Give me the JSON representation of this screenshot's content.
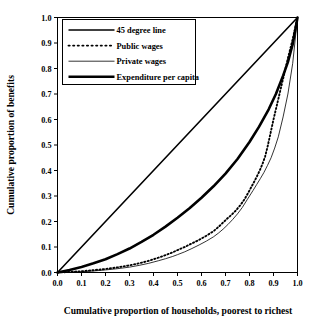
{
  "chart_data": {
    "type": "line",
    "title": "",
    "xlabel": "Cumulative proportion of households, poorest to richest",
    "ylabel": "Cumulative proportion of benefits",
    "xlim": [
      0.0,
      1.0
    ],
    "ylim": [
      0.0,
      1.0
    ],
    "grid": false,
    "legend_position": "top-left",
    "xticks": [
      "0.0",
      "0.1",
      "0.2",
      "0.3",
      "0.4",
      "0.5",
      "0.6",
      "0.7",
      "0.8",
      "0.9",
      "1.0"
    ],
    "yticks": [
      "0.0",
      "0.1",
      "0.2",
      "0.3",
      "0.4",
      "0.5",
      "0.6",
      "0.7",
      "0.8",
      "0.9",
      "1.0"
    ],
    "xtick_values": [
      0.0,
      0.1,
      0.2,
      0.3,
      0.4,
      0.5,
      0.6,
      0.7,
      0.8,
      0.9,
      1.0
    ],
    "ytick_values": [
      0.0,
      0.1,
      0.2,
      0.3,
      0.4,
      0.5,
      0.6,
      0.7,
      0.8,
      0.9,
      1.0
    ],
    "series": [
      {
        "name": "45 degree line",
        "style": "solid",
        "width": 1.6,
        "color": "#000000",
        "x": [
          0.0,
          1.0
        ],
        "y": [
          0.0,
          1.0
        ]
      },
      {
        "name": "Public wages",
        "style": "dotted",
        "width": 1.9,
        "color": "#000000",
        "x": [
          0.0,
          0.05,
          0.1,
          0.15,
          0.2,
          0.25,
          0.3,
          0.34,
          0.38,
          0.42,
          0.45,
          0.48,
          0.5,
          0.53,
          0.56,
          0.59,
          0.62,
          0.65,
          0.67,
          0.69,
          0.71,
          0.72,
          0.74,
          0.76,
          0.78,
          0.79,
          0.8,
          0.815,
          0.83,
          0.845,
          0.855,
          0.865,
          0.875,
          0.885,
          0.9,
          0.92,
          0.94,
          0.96,
          0.98,
          1.0
        ],
        "y": [
          0.0,
          0.002,
          0.005,
          0.009,
          0.014,
          0.02,
          0.028,
          0.036,
          0.046,
          0.058,
          0.068,
          0.079,
          0.088,
          0.1,
          0.114,
          0.128,
          0.144,
          0.162,
          0.178,
          0.196,
          0.214,
          0.222,
          0.24,
          0.262,
          0.288,
          0.305,
          0.322,
          0.348,
          0.375,
          0.405,
          0.428,
          0.455,
          0.492,
          0.535,
          0.6,
          0.68,
          0.76,
          0.84,
          0.915,
          1.0
        ]
      },
      {
        "name": "Private wages",
        "style": "solid",
        "width": 0.8,
        "color": "#000000",
        "x": [
          0.0,
          0.05,
          0.1,
          0.15,
          0.2,
          0.25,
          0.3,
          0.34,
          0.38,
          0.42,
          0.45,
          0.48,
          0.5,
          0.53,
          0.56,
          0.59,
          0.62,
          0.65,
          0.67,
          0.69,
          0.71,
          0.73,
          0.75,
          0.77,
          0.79,
          0.8,
          0.815,
          0.83,
          0.845,
          0.86,
          0.875,
          0.89,
          0.905,
          0.92,
          0.94,
          0.96,
          0.98,
          1.0
        ],
        "y": [
          0.0,
          0.001,
          0.003,
          0.006,
          0.01,
          0.015,
          0.021,
          0.028,
          0.036,
          0.046,
          0.054,
          0.063,
          0.07,
          0.081,
          0.094,
          0.108,
          0.123,
          0.14,
          0.154,
          0.17,
          0.188,
          0.208,
          0.23,
          0.255,
          0.285,
          0.3,
          0.322,
          0.345,
          0.368,
          0.392,
          0.42,
          0.45,
          0.488,
          0.532,
          0.61,
          0.7,
          0.82,
          1.0
        ]
      },
      {
        "name": "Expenditure per capita",
        "style": "solid",
        "width": 2.6,
        "color": "#000000",
        "x": [
          0.0,
          0.05,
          0.1,
          0.15,
          0.2,
          0.25,
          0.3,
          0.35,
          0.4,
          0.45,
          0.5,
          0.55,
          0.6,
          0.65,
          0.7,
          0.75,
          0.8,
          0.84,
          0.88,
          0.91,
          0.94,
          0.96,
          0.98,
          1.0
        ],
        "y": [
          0.0,
          0.01,
          0.022,
          0.036,
          0.052,
          0.072,
          0.094,
          0.12,
          0.148,
          0.18,
          0.215,
          0.252,
          0.293,
          0.338,
          0.388,
          0.445,
          0.512,
          0.572,
          0.64,
          0.7,
          0.772,
          0.825,
          0.895,
          1.0
        ]
      }
    ],
    "legend": [
      {
        "label": "45 degree line",
        "style": "solid",
        "width": 1.6
      },
      {
        "label": "Public wages",
        "style": "dotted",
        "width": 1.9
      },
      {
        "label": "Private wages",
        "style": "solid",
        "width": 0.8
      },
      {
        "label": "Expenditure per capita",
        "style": "solid",
        "width": 2.6
      }
    ]
  }
}
